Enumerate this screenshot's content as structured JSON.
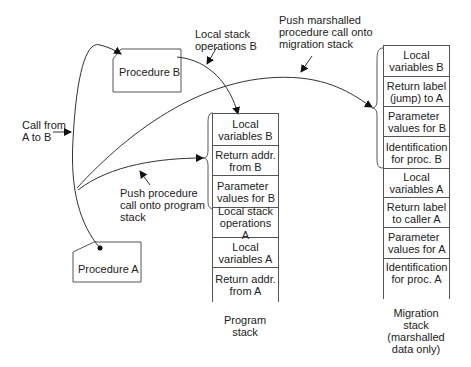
{
  "procedures": {
    "a": "Procedure A",
    "b": "Procedure B"
  },
  "labels": {
    "local_stack_ops_b": [
      "Local stack",
      "operations B"
    ],
    "push_marshalled": [
      "Push marshalled",
      "procedure call onto",
      "migration stack"
    ],
    "call_from": [
      "Call from",
      "A to B"
    ],
    "push_procedure": [
      "Push procedure",
      "call onto program",
      "stack"
    ]
  },
  "program_stack": {
    "title": [
      "Program",
      "stack"
    ],
    "cells": [
      [
        "Local",
        "variables B"
      ],
      [
        "Return addr.",
        "from B"
      ],
      [
        "Parameter",
        "values for B"
      ],
      [
        "Local stack",
        "operations A"
      ],
      [
        "Local",
        "variables A"
      ],
      [
        "Return addr.",
        "from A"
      ]
    ]
  },
  "migration_stack": {
    "title": [
      "Migration",
      "stack",
      "(marshalled",
      "data only)"
    ],
    "cells": [
      [
        "Local",
        "variables B"
      ],
      [
        "Return label",
        "(jump) to A"
      ],
      [
        "Parameter",
        "values for B"
      ],
      [
        "Identification",
        "for proc. B"
      ],
      [
        "Local",
        "variables A"
      ],
      [
        "Return label",
        "to caller A"
      ],
      [
        "Parameter",
        "values for A"
      ],
      [
        "Identification",
        "for proc. A"
      ]
    ]
  }
}
